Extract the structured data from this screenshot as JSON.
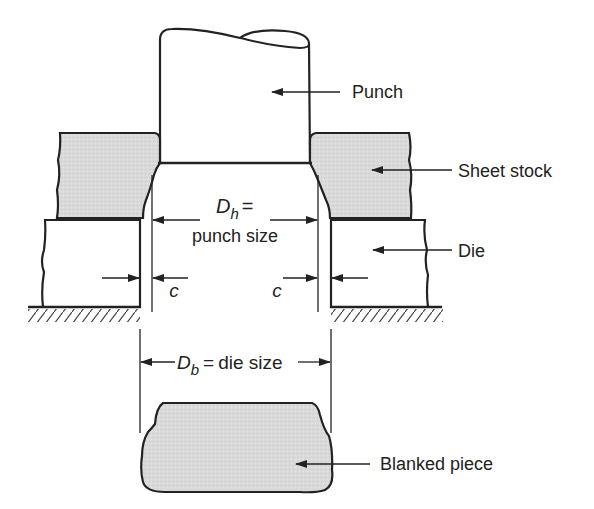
{
  "diagram": {
    "type": "cross-section",
    "colors": {
      "line": "#222222",
      "stock_fill": "#d9d9d9",
      "background": "#ffffff"
    },
    "labels": {
      "punch": "Punch",
      "sheet_stock": "Sheet stock",
      "die": "Die",
      "blanked_piece": "Blanked piece"
    },
    "dimensions": {
      "punch_size": {
        "symbol": "D",
        "subscript": "h",
        "equals": "=",
        "text": "punch size"
      },
      "die_size": {
        "symbol": "D",
        "subscript": "b",
        "equals": "=",
        "text": "die size"
      },
      "clearance": {
        "symbol_left": "c",
        "symbol_right": "c"
      }
    }
  }
}
